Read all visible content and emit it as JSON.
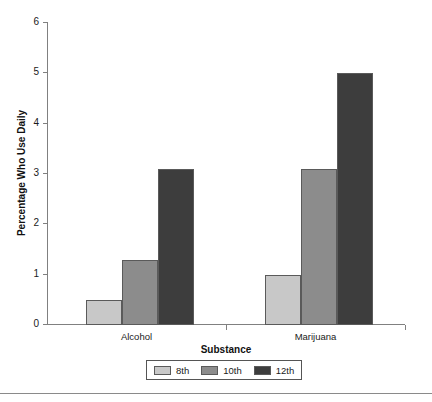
{
  "chart_data": {
    "type": "bar",
    "title": "",
    "subtitle": "",
    "xlabel": "Substance",
    "ylabel": "Percentage Who Use Daily",
    "categories": [
      "Alcohol",
      "Marijuana"
    ],
    "series": [
      {
        "name": "8th",
        "values": [
          0.5,
          1.0
        ],
        "color": "#c8c8c8"
      },
      {
        "name": "10th",
        "values": [
          1.3,
          3.1
        ],
        "color": "#8c8c8c"
      },
      {
        "name": "12th",
        "values": [
          3.1,
          5.0
        ],
        "color": "#3d3d3d"
      }
    ],
    "ylim": [
      0,
      6
    ],
    "yticks": [
      0,
      1,
      2,
      3,
      4,
      5,
      6
    ],
    "ytick_labels": [
      "0",
      "1",
      "2",
      "3",
      "4",
      "5",
      "6"
    ],
    "grid": false,
    "legend_position": "bottom-center",
    "legend_entries": [
      "8th",
      "10th",
      "12th"
    ],
    "bar_edge_color": "#5a5a5a",
    "axis_color": "#808080",
    "background": "#ffffff"
  }
}
